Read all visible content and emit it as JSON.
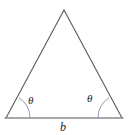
{
  "figure": {
    "type": "geometry-diagram",
    "shape": "isosceles-triangle",
    "background_color": "#ffffff",
    "labels": {
      "angle_left": "θ",
      "angle_right": "θ",
      "base": "b"
    },
    "geometry": {
      "apex": [
        64,
        10
      ],
      "base_left_vertex": [
        6,
        118
      ],
      "base_right_vertex": [
        122,
        118
      ],
      "angle_arc_radius_left": 24,
      "angle_arc_radius_right": 24
    },
    "colors": {
      "side_stroke": "#595959",
      "base_stroke": "#8c8c8c",
      "arc_stroke": "#7f93b0",
      "label_text": "#1c1c1c"
    },
    "stroke_widths": {
      "side": 1.1,
      "base": 1.6,
      "arc": 0.9
    }
  }
}
